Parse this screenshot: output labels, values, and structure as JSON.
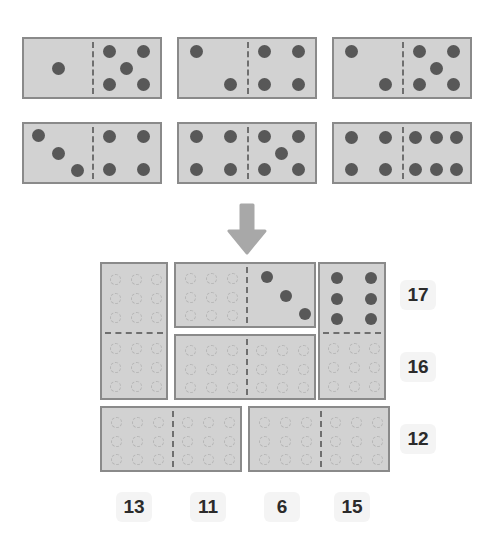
{
  "puzzle": {
    "title": "domino-placement-puzzle",
    "arrow_icon": "arrow-down-icon",
    "colors": {
      "tile_fill": "#d2d2d2",
      "tile_border": "#8a8a8a",
      "pip": "#585858",
      "empty_slot_outline": "#b6b6b6",
      "label_background": "#f4f4f4",
      "label_text": "#2b2b2b",
      "arrow": "#a8a8a8"
    },
    "source_dominoes": [
      {
        "id": "source-domino-1",
        "left_pips": 1,
        "right_pips": 5,
        "left_positions": [
          [
            0.5,
            0.5
          ]
        ],
        "right_positions": [
          [
            0.25,
            0.22
          ],
          [
            0.75,
            0.22
          ],
          [
            0.5,
            0.5
          ],
          [
            0.25,
            0.78
          ],
          [
            0.75,
            0.78
          ]
        ]
      },
      {
        "id": "source-domino-2",
        "left_pips": 2,
        "right_pips": 4,
        "left_positions": [
          [
            0.25,
            0.22
          ],
          [
            0.75,
            0.78
          ]
        ],
        "right_positions": [
          [
            0.25,
            0.22
          ],
          [
            0.75,
            0.22
          ],
          [
            0.25,
            0.78
          ],
          [
            0.75,
            0.78
          ]
        ]
      },
      {
        "id": "source-domino-3",
        "left_pips": 2,
        "right_pips": 5,
        "left_positions": [
          [
            0.25,
            0.22
          ],
          [
            0.75,
            0.78
          ]
        ],
        "right_positions": [
          [
            0.25,
            0.22
          ],
          [
            0.75,
            0.22
          ],
          [
            0.5,
            0.5
          ],
          [
            0.25,
            0.78
          ],
          [
            0.75,
            0.78
          ]
        ]
      },
      {
        "id": "source-domino-4",
        "left_pips": 3,
        "right_pips": 4,
        "left_positions": [
          [
            0.22,
            0.2
          ],
          [
            0.5,
            0.5
          ],
          [
            0.78,
            0.8
          ]
        ],
        "right_positions": [
          [
            0.25,
            0.22
          ],
          [
            0.75,
            0.22
          ],
          [
            0.25,
            0.78
          ],
          [
            0.75,
            0.78
          ]
        ]
      },
      {
        "id": "source-domino-5",
        "left_pips": 4,
        "right_pips": 5,
        "left_positions": [
          [
            0.25,
            0.22
          ],
          [
            0.75,
            0.22
          ],
          [
            0.25,
            0.78
          ],
          [
            0.75,
            0.78
          ]
        ],
        "right_positions": [
          [
            0.25,
            0.22
          ],
          [
            0.75,
            0.22
          ],
          [
            0.5,
            0.5
          ],
          [
            0.25,
            0.78
          ],
          [
            0.75,
            0.78
          ]
        ]
      },
      {
        "id": "source-domino-6",
        "left_pips": 4,
        "right_pips": 6,
        "left_positions": [
          [
            0.25,
            0.24
          ],
          [
            0.75,
            0.24
          ],
          [
            0.25,
            0.78
          ],
          [
            0.75,
            0.78
          ]
        ],
        "right_positions": [
          [
            0.2,
            0.24
          ],
          [
            0.5,
            0.24
          ],
          [
            0.8,
            0.24
          ],
          [
            0.2,
            0.78
          ],
          [
            0.5,
            0.78
          ],
          [
            0.8,
            0.78
          ]
        ]
      }
    ],
    "grid": {
      "rows": 3,
      "cols": 4,
      "row_sums": [
        "17",
        "16",
        "12"
      ],
      "col_sums": [
        "13",
        "11",
        "6",
        "15"
      ],
      "placed_tiles": [
        {
          "id": "grid-tile-col1-vertical",
          "orientation": "vertical",
          "cells": [
            "r1c1",
            "r2c1"
          ],
          "first_half_pips": 0,
          "second_half_pips": 0
        },
        {
          "id": "grid-tile-row1-mid",
          "orientation": "horizontal",
          "cells": [
            "r1c2",
            "r1c3"
          ],
          "first_half_pips": 0,
          "second_half_pips": 3,
          "second_half_positions": [
            [
              0.28,
              0.2
            ],
            [
              0.55,
              0.48
            ],
            [
              0.82,
              0.76
            ]
          ]
        },
        {
          "id": "grid-tile-col4-vertical",
          "orientation": "vertical",
          "cells": [
            "r1c4",
            "r2c4"
          ],
          "first_half_pips": 6,
          "second_half_pips": 0,
          "first_half_positions": [
            [
              0.25,
              0.2
            ],
            [
              0.75,
              0.2
            ],
            [
              0.25,
              0.5
            ],
            [
              0.75,
              0.5
            ],
            [
              0.25,
              0.8
            ],
            [
              0.75,
              0.8
            ]
          ]
        },
        {
          "id": "grid-tile-row2-mid",
          "orientation": "horizontal",
          "cells": [
            "r2c2",
            "r2c3"
          ],
          "first_half_pips": 0,
          "second_half_pips": 0
        },
        {
          "id": "grid-tile-row3-left",
          "orientation": "horizontal",
          "cells": [
            "r3c1",
            "r3c2"
          ],
          "first_half_pips": 0,
          "second_half_pips": 0
        },
        {
          "id": "grid-tile-row3-right",
          "orientation": "horizontal",
          "cells": [
            "r3c3",
            "r3c4"
          ],
          "first_half_pips": 0,
          "second_half_pips": 0
        }
      ]
    }
  }
}
